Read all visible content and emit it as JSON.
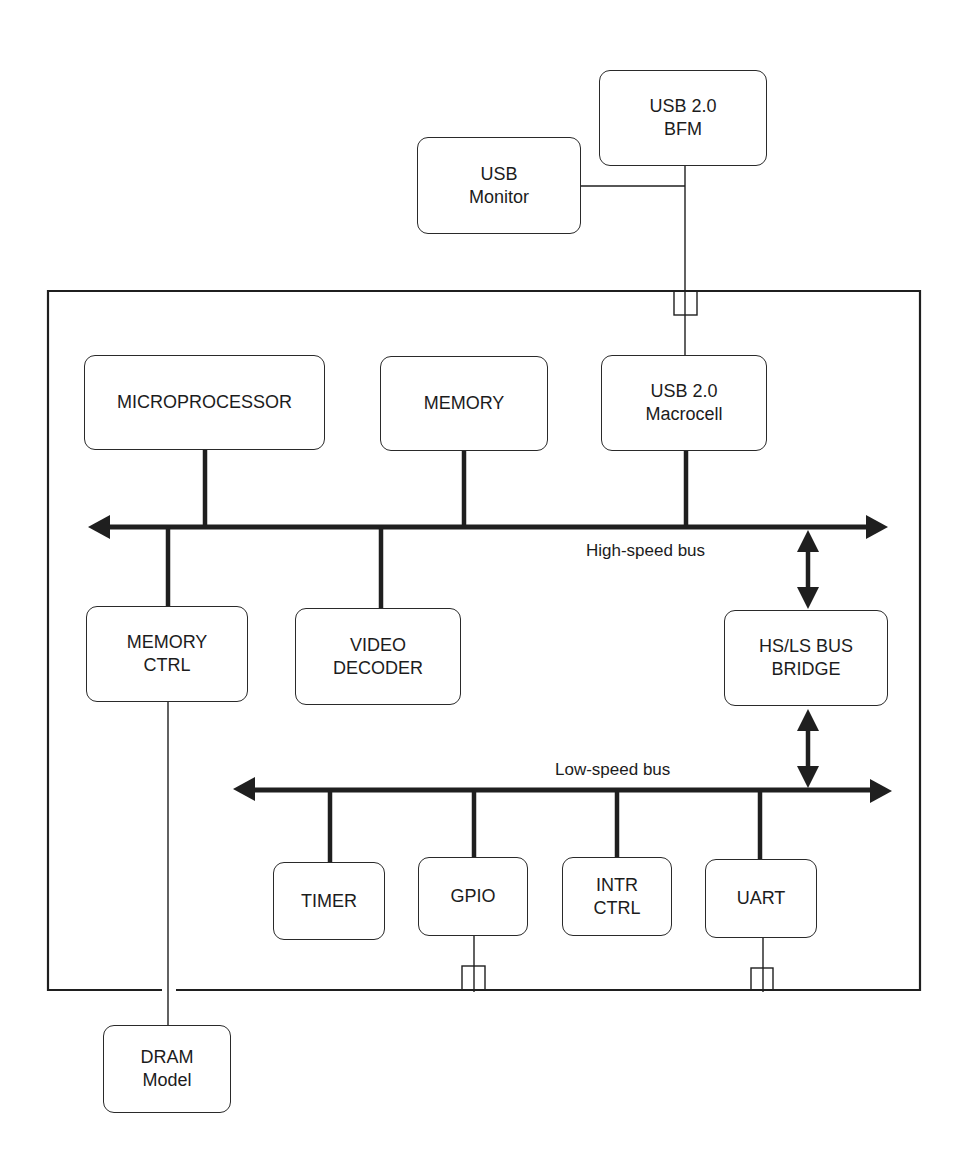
{
  "diagram": {
    "colors": {
      "line": "#1f1f1f",
      "background": "#ffffff",
      "text": "#1c1c1c"
    },
    "external": {
      "usb_bfm": "USB 2.0\nBFM",
      "usb_monitor": "USB\nMonitor",
      "dram_model": "DRAM\nModel"
    },
    "soc": {
      "microprocessor": "MICROPROCESSOR",
      "memory": "MEMORY",
      "usb_macrocell": "USB 2.0\nMacrocell",
      "memory_ctrl": "MEMORY\nCTRL",
      "video_decoder": "VIDEO\nDECODER",
      "bus_bridge": "HS/LS BUS\nBRIDGE",
      "timer": "TIMER",
      "gpio": "GPIO",
      "intr_ctrl": "INTR\nCTRL",
      "uart": "UART"
    },
    "buses": {
      "high_speed": "High-speed bus",
      "low_speed": "Low-speed bus"
    }
  }
}
